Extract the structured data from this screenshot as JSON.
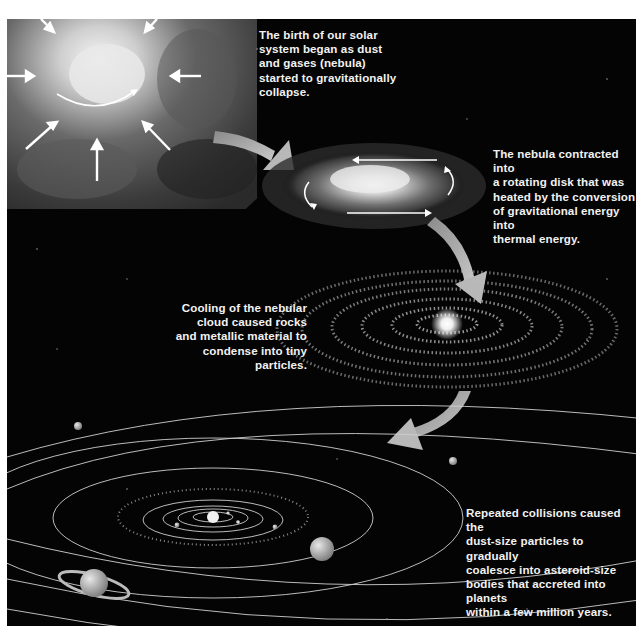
{
  "figure": {
    "background_color": "#040404",
    "accent_color": "#bdbdbd",
    "text_color": "#f2f2f2"
  },
  "stages": [
    {
      "id": "nebula-collapse",
      "icon": "collapsing-nebula-cloud",
      "caption": "The birth of our solar\nsystem began as dust\nand gases (nebula)\nstarted to gravitationally\ncollapse."
    },
    {
      "id": "rotating-disk",
      "icon": "rotating-disk-galaxy",
      "caption": "The nebula contracted into\na rotating disk that was\nheated by the conversion\nof gravitational energy into\nthermal energy."
    },
    {
      "id": "condensation",
      "icon": "ringed-protoplanetary-disk",
      "caption": "Cooling of the nebular\ncloud caused rocks\nand metallic material to\ncondense into tiny\nparticles."
    },
    {
      "id": "accretion",
      "icon": "solar-system-orbits",
      "caption": "Repeated collisions caused the\ndust-size particles to gradually\ncoalesce into asteroid-size\nbodies that accreted into planets\nwithin a few million years."
    }
  ],
  "arrows": [
    {
      "from": "nebula-collapse",
      "to": "rotating-disk",
      "icon": "curved-arrow-right"
    },
    {
      "from": "rotating-disk",
      "to": "condensation",
      "icon": "curved-arrow-down"
    },
    {
      "from": "condensation",
      "to": "accretion",
      "icon": "curved-arrow-down-left"
    }
  ]
}
